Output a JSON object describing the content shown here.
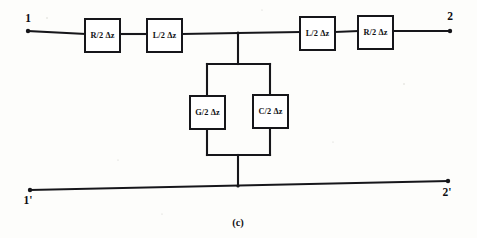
{
  "figure": {
    "caption": "(c)",
    "title_description": "Lumped-element equivalent circuit of a transmission line section",
    "background_color": "#fdfdfb",
    "line_color": "#16161a"
  },
  "terminals": [
    {
      "name": "terminal-1",
      "label": "1",
      "x": 28,
      "y": 31,
      "label_x": 28,
      "label_y": 22,
      "position": "top-left"
    },
    {
      "name": "terminal-2",
      "label": "2",
      "x": 450,
      "y": 31,
      "label_x": 450,
      "label_y": 20,
      "position": "top-right"
    },
    {
      "name": "terminal-1-prime",
      "label": "1'",
      "x": 30,
      "y": 190,
      "label_x": 28,
      "label_y": 204,
      "position": "bottom-left"
    },
    {
      "name": "terminal-2-prime",
      "label": "2'",
      "x": 448,
      "y": 181,
      "label_x": 447,
      "label_y": 196,
      "position": "bottom-right"
    }
  ],
  "components": [
    {
      "name": "series-resistor-left",
      "symbol": "R/2",
      "delta": "Δz",
      "label": "R/2 Δz",
      "x": 85,
      "y": 19,
      "w": 35,
      "h": 33,
      "branch": "series-top-left"
    },
    {
      "name": "series-inductor-left",
      "symbol": "L/2",
      "delta": "Δz",
      "label": "L/2 Δz",
      "x": 147,
      "y": 19,
      "w": 35,
      "h": 33,
      "branch": "series-top-left"
    },
    {
      "name": "series-inductor-right",
      "symbol": "L/2",
      "delta": "Δz",
      "label": "L/2 Δz",
      "x": 300,
      "y": 17,
      "w": 35,
      "h": 33,
      "branch": "series-top-right"
    },
    {
      "name": "series-resistor-right",
      "symbol": "R/2",
      "delta": "Δz",
      "label": "R/2 Δz",
      "x": 358,
      "y": 16,
      "w": 35,
      "h": 33,
      "branch": "series-top-right"
    },
    {
      "name": "shunt-conductance",
      "symbol": "G/2",
      "delta": "Δz",
      "label": "G/2 Δz",
      "x": 190,
      "y": 96,
      "w": 35,
      "h": 33,
      "branch": "shunt-left-leg"
    },
    {
      "name": "shunt-capacitor",
      "symbol": "C/2",
      "delta": "Δz",
      "label": "C/2 Δz",
      "x": 253,
      "y": 95,
      "w": 35,
      "h": 33,
      "branch": "shunt-right-leg"
    }
  ],
  "wires": [
    {
      "name": "wire-top-left-lead",
      "d": "M 28 31 L 85 34"
    },
    {
      "name": "wire-top-left-between",
      "d": "M 120 34 L 147 34"
    },
    {
      "name": "wire-top-left-to-node",
      "d": "M 182 34 L 238 33"
    },
    {
      "name": "wire-top-node-to-right",
      "d": "M 238 33 L 300 32"
    },
    {
      "name": "wire-top-right-between",
      "d": "M 335 32 L 358 31"
    },
    {
      "name": "wire-top-right-lead",
      "d": "M 393 31 L 450 31"
    },
    {
      "name": "wire-shunt-drop-upper",
      "d": "M 238 33 L 238 64"
    },
    {
      "name": "wire-shunt-loop-top",
      "d": "M 207 64 L 270 64"
    },
    {
      "name": "wire-shunt-left-upper",
      "d": "M 207 64 L 207 96"
    },
    {
      "name": "wire-shunt-left-lower",
      "d": "M 207 129 L 207 155"
    },
    {
      "name": "wire-shunt-right-upper",
      "d": "M 270 64 L 270 95"
    },
    {
      "name": "wire-shunt-right-lower",
      "d": "M 270 128 L 270 155"
    },
    {
      "name": "wire-shunt-loop-bottom",
      "d": "M 207 155 L 270 155"
    },
    {
      "name": "wire-shunt-drop-lower",
      "d": "M 238 155 L 238 186"
    },
    {
      "name": "wire-bottom-rail",
      "d": "M 30 190 L 448 181"
    }
  ],
  "junctions": [
    {
      "name": "junction-top-node",
      "x": 238,
      "y": 33
    },
    {
      "name": "junction-bottom-node",
      "x": 238,
      "y": 186
    }
  ]
}
